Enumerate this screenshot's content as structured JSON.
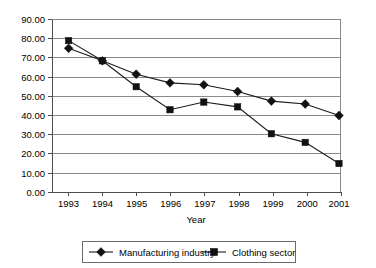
{
  "chart_data": {
    "type": "line",
    "title": "",
    "xlabel": "Year",
    "ylabel": "",
    "categories": [
      "1993",
      "1994",
      "1995",
      "1996",
      "1997",
      "1998",
      "1999",
      "2000",
      "2001"
    ],
    "x": [
      1993,
      1994,
      1995,
      1996,
      1997,
      1998,
      1999,
      2000,
      2001
    ],
    "series": [
      {
        "name": "Manufacturing industry",
        "marker": "diamond",
        "color": "#111111",
        "values": [
          75.0,
          68.5,
          61.5,
          57.0,
          56.0,
          52.5,
          47.5,
          46.0,
          40.0
        ]
      },
      {
        "name": "Clothing sector",
        "marker": "square",
        "color": "#111111",
        "values": [
          79.0,
          68.5,
          55.0,
          43.0,
          47.0,
          44.5,
          30.5,
          26.0,
          15.0
        ]
      }
    ],
    "ylim": [
      0,
      90
    ],
    "ytick_step": 10,
    "ytick_labels": [
      "0.00",
      "10.00",
      "20.00",
      "30.00",
      "40.00",
      "50.00",
      "60.00",
      "70.00",
      "80.00",
      "90.00"
    ],
    "grid": true,
    "grid_axis": "y",
    "legend_position": "bottom"
  },
  "axes": {
    "x_title": "Year",
    "x_tick_labels": [
      "1993",
      "1994",
      "1995",
      "1996",
      "1997",
      "1998",
      "1999",
      "2000",
      "2001"
    ],
    "y_tick_labels": [
      "90.00",
      "80.00",
      "70.00",
      "60.00",
      "50.00",
      "40.00",
      "30.00",
      "20.00",
      "10.00",
      "0.00"
    ]
  },
  "legend": {
    "entries": [
      {
        "label": "Manufacturing industry",
        "marker": "diamond"
      },
      {
        "label": "Clothing sector",
        "marker": "square"
      }
    ]
  }
}
